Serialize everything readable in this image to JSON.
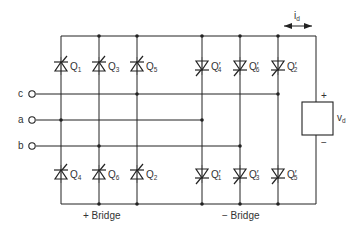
{
  "diagram": {
    "type": "dual-converter-circuit",
    "inputs": [
      {
        "label": "c",
        "y": 94
      },
      {
        "label": "a",
        "y": 120
      },
      {
        "label": "b",
        "y": 146
      }
    ],
    "positive_bridge": {
      "caption": "+ Bridge",
      "upper": [
        {
          "name": "Q",
          "sub": "1"
        },
        {
          "name": "Q",
          "sub": "3"
        },
        {
          "name": "Q",
          "sub": "5"
        }
      ],
      "lower": [
        {
          "name": "Q",
          "sub": "4"
        },
        {
          "name": "Q",
          "sub": "6"
        },
        {
          "name": "Q",
          "sub": "2"
        }
      ]
    },
    "negative_bridge": {
      "caption": "− Bridge",
      "upper": [
        {
          "name": "Q′",
          "sub": "4"
        },
        {
          "name": "Q′",
          "sub": "6"
        },
        {
          "name": "Q′",
          "sub": "2"
        }
      ],
      "lower": [
        {
          "name": "Q′",
          "sub": "1"
        },
        {
          "name": "Q′",
          "sub": "3"
        },
        {
          "name": "Q′",
          "sub": "5"
        }
      ]
    },
    "load": {
      "voltage_label": "v",
      "voltage_sub": "d",
      "plus": "+",
      "minus": "−"
    },
    "current": {
      "label": "i",
      "sub": "d"
    }
  }
}
